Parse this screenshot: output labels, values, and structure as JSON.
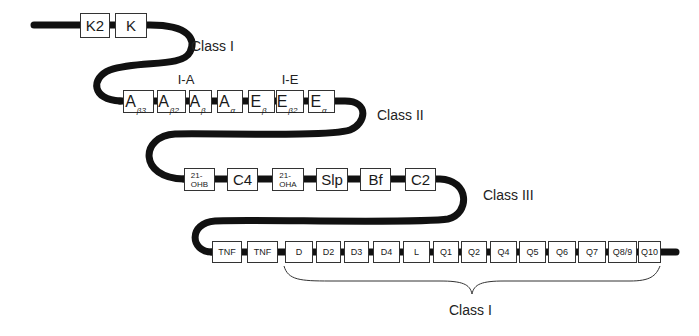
{
  "diagram": {
    "type": "gene-map",
    "stroke_color": "#111111",
    "rows": [
      {
        "row": 1,
        "genes": [
          {
            "id": "K2",
            "label": "K2"
          },
          {
            "id": "K",
            "label": "K"
          }
        ],
        "class_label": "Class I"
      },
      {
        "row": 2,
        "group_labels": [
          {
            "label": "I-A"
          },
          {
            "label": "I-E"
          }
        ],
        "genes": [
          {
            "id": "Ab3",
            "main": "A",
            "sub": "β3"
          },
          {
            "id": "Ab2",
            "main": "A",
            "sub": "β2"
          },
          {
            "id": "Ab",
            "main": "A",
            "sub": "β"
          },
          {
            "id": "Aa",
            "main": "A",
            "sub": "α"
          },
          {
            "id": "Eb",
            "main": "E",
            "sub": "β"
          },
          {
            "id": "Eb2",
            "main": "E",
            "sub": "β2"
          },
          {
            "id": "Ea",
            "main": "E",
            "sub": "α"
          }
        ],
        "class_label": "Class II"
      },
      {
        "row": 3,
        "genes": [
          {
            "id": "21-OHB",
            "line1": "21-",
            "line2": "OHB"
          },
          {
            "id": "C4",
            "label": "C4"
          },
          {
            "id": "21-OHA",
            "line1": "21-",
            "line2": "OHA"
          },
          {
            "id": "Slp",
            "label": "Slp"
          },
          {
            "id": "Bf",
            "label": "Bf"
          },
          {
            "id": "C2",
            "label": "C2"
          }
        ],
        "class_label": "Class III"
      },
      {
        "row": 4,
        "genes": [
          {
            "id": "TNF-1",
            "label": "TNF"
          },
          {
            "id": "TNF-2",
            "label": "TNF"
          },
          {
            "id": "D",
            "label": "D"
          },
          {
            "id": "D2",
            "label": "D2"
          },
          {
            "id": "D3",
            "label": "D3"
          },
          {
            "id": "D4",
            "label": "D4"
          },
          {
            "id": "L",
            "label": "L"
          },
          {
            "id": "Q1",
            "label": "Q1"
          },
          {
            "id": "Q2",
            "label": "Q2"
          },
          {
            "id": "Q4",
            "label": "Q4"
          },
          {
            "id": "Q5",
            "label": "Q5"
          },
          {
            "id": "Q6",
            "label": "Q6"
          },
          {
            "id": "Q7",
            "label": "Q7"
          },
          {
            "id": "Q8/9",
            "label": "Q8/9"
          },
          {
            "id": "Q10",
            "label": "Q10"
          }
        ],
        "brace_label": "Class I"
      }
    ]
  }
}
